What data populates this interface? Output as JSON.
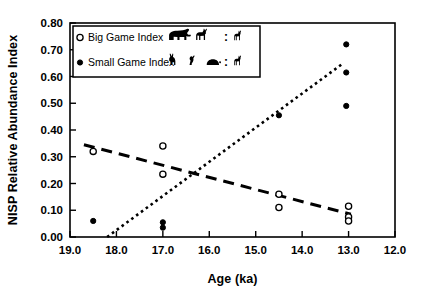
{
  "chart_data": {
    "type": "scatter",
    "title": "",
    "xlabel": "Age (ka)",
    "ylabel": "NISP Relative Abundance Index",
    "xlim": [
      19.0,
      12.0
    ],
    "ylim": [
      0.0,
      0.8
    ],
    "x_reversed": true,
    "grid": false,
    "xticks": [
      19.0,
      18.0,
      17.0,
      16.0,
      15.0,
      14.0,
      13.0,
      12.0
    ],
    "xtick_labels": [
      "19.0",
      "18.0",
      "17.0",
      "16.0",
      "15.0",
      "14.0",
      "13.0",
      "12.0"
    ],
    "yticks": [
      0.0,
      0.1,
      0.2,
      0.3,
      0.4,
      0.5,
      0.6,
      0.7,
      0.8
    ],
    "ytick_labels": [
      "0.00",
      "0.10",
      "0.20",
      "0.30",
      "0.40",
      "0.50",
      "0.60",
      "0.70",
      "0.80"
    ],
    "legend_position": "top-left-inside",
    "series": [
      {
        "name": "Big Game Index",
        "marker": "open-circle",
        "points": [
          {
            "x": 18.5,
            "y": 0.32
          },
          {
            "x": 17.0,
            "y": 0.34
          },
          {
            "x": 17.0,
            "y": 0.235
          },
          {
            "x": 14.5,
            "y": 0.16
          },
          {
            "x": 14.5,
            "y": 0.11
          },
          {
            "x": 13.0,
            "y": 0.115
          },
          {
            "x": 13.0,
            "y": 0.075
          },
          {
            "x": 13.0,
            "y": 0.06
          }
        ],
        "trendline": {
          "style": "dashed",
          "x_start": 18.7,
          "y_start": 0.345,
          "x_end": 12.95,
          "y_end": 0.085
        }
      },
      {
        "name": "Small Game Index",
        "marker": "filled-circle",
        "points": [
          {
            "x": 18.5,
            "y": 0.06
          },
          {
            "x": 17.0,
            "y": 0.055
          },
          {
            "x": 17.0,
            "y": 0.035
          },
          {
            "x": 15.7,
            "y": 0.7
          },
          {
            "x": 14.5,
            "y": 0.455
          },
          {
            "x": 13.05,
            "y": 0.72
          },
          {
            "x": 13.05,
            "y": 0.615
          },
          {
            "x": 13.05,
            "y": 0.49
          }
        ],
        "trendline": {
          "style": "dotted",
          "x_start": 18.2,
          "y_start": 0.0,
          "x_end": 13.15,
          "y_end": 0.645
        }
      }
    ]
  },
  "legend": {
    "rows": [
      {
        "marker": "open-circle",
        "label": "Big Game Index",
        "icons": [
          "bison-icon",
          "deer-icon"
        ],
        "separator": ":",
        "trailing_icons": [
          "small-mammal-icon"
        ]
      },
      {
        "marker": "filled-circle",
        "label": "Small Game Index",
        "icons": [
          "rabbit-icon",
          "bird-icon",
          "tortoise-icon"
        ],
        "separator": ":",
        "trailing_icons": [
          "small-mammal-icon"
        ]
      }
    ]
  },
  "colors": {
    "axis": "#000000",
    "marker": "#000000",
    "background": "#ffffff"
  }
}
